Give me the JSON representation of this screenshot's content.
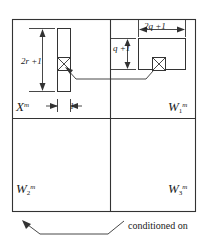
{
  "figure": {
    "title_visible": false,
    "background": "#ffffff",
    "line_color": "#333333",
    "frame": {
      "x": 12,
      "y": 19,
      "width": 184,
      "height": 193
    },
    "divider_center": {
      "x": 110,
      "y": 118
    }
  },
  "quadrants": [
    {
      "id": "top-left",
      "base": "X",
      "sub": "",
      "sup": "m",
      "text": "X"
    },
    {
      "id": "top-right",
      "base": "W",
      "sub": "1",
      "sup": "m",
      "text": "W"
    },
    {
      "id": "bottom-left",
      "base": "W",
      "sub": "2",
      "sup": "m",
      "text": "W"
    },
    {
      "id": "bottom-right",
      "base": "W",
      "sub": "3",
      "sup": "m",
      "text": "W"
    }
  ],
  "shapes": {
    "left_column": {
      "name": "vertical-strip",
      "x": 57,
      "y": 28,
      "width": 14,
      "height": 64,
      "marked_cell": {
        "x": 57,
        "y": 57,
        "width": 14,
        "height": 13,
        "glyph": "crossed-box"
      }
    },
    "right_block": {
      "name": "horizontal-block",
      "x": 138,
      "y": 38,
      "width": 48,
      "height": 32,
      "marked_cell": {
        "x": 152,
        "y": 57,
        "width": 14,
        "height": 13,
        "glyph": "crossed-box"
      }
    }
  },
  "dimensions": {
    "height_left": "2r +1",
    "width_left": "1",
    "width_right": "2q +1",
    "height_right": "q +1"
  },
  "annotations": {
    "conditioned_on": "conditioned on"
  },
  "colors": {
    "stroke": "#333333",
    "text": "#1a1a1a",
    "fill": "#ffffff"
  }
}
